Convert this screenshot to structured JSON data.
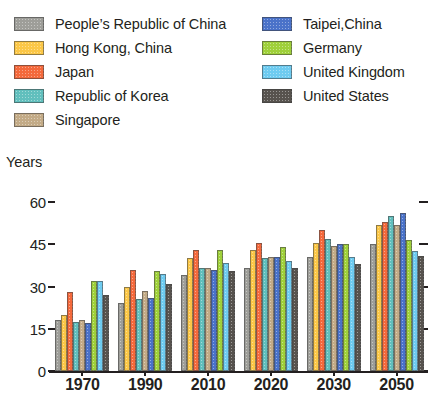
{
  "legend": {
    "left_column": [
      {
        "label": "People’s Republic of China",
        "color": "#9e9e99",
        "swatch_name": "legend-swatch-prc"
      },
      {
        "label": "Hong Kong, China",
        "color": "#fbc747",
        "swatch_name": "legend-swatch-hong-kong"
      },
      {
        "label": "Japan",
        "color": "#f4693c",
        "swatch_name": "legend-swatch-japan"
      },
      {
        "label": "Republic of Korea",
        "color": "#61bfbd",
        "swatch_name": "legend-swatch-korea"
      },
      {
        "label": "Singapore",
        "color": "#c3ab87",
        "swatch_name": "legend-swatch-singapore"
      }
    ],
    "right_column": [
      {
        "label": "Taipei,China",
        "color": "#4a72c9",
        "swatch_name": "legend-swatch-taipei"
      },
      {
        "label": "Germany",
        "color": "#9fd03a",
        "swatch_name": "legend-swatch-germany"
      },
      {
        "label": "United Kingdom",
        "color": "#6ecbf0",
        "swatch_name": "legend-swatch-uk"
      },
      {
        "label": "United States",
        "color": "#57534e",
        "swatch_name": "legend-swatch-usa"
      }
    ]
  },
  "chart_data": {
    "type": "bar",
    "title": "",
    "xlabel": "",
    "ylabel": "Years",
    "ylim": [
      0,
      60
    ],
    "yticks": [
      0,
      15,
      30,
      45,
      60
    ],
    "ytick_labels": [
      "0",
      "15",
      "30",
      "45",
      "60"
    ],
    "grid": false,
    "legend_position": "top",
    "categories": [
      "1970",
      "1990",
      "2010",
      "2020",
      "2030",
      "2050"
    ],
    "series": [
      {
        "name": "People’s Republic of China",
        "color": "#9e9e99",
        "values": [
          18,
          24,
          34,
          36.5,
          40.5,
          45
        ]
      },
      {
        "name": "Hong Kong, China",
        "color": "#fbc747",
        "values": [
          20,
          30,
          40,
          43,
          45.5,
          52
        ]
      },
      {
        "name": "Japan",
        "color": "#f4693c",
        "values": [
          28,
          36,
          43,
          45.5,
          50,
          53
        ]
      },
      {
        "name": "Republic of Korea",
        "color": "#61bfbd",
        "values": [
          17.5,
          25.5,
          36.5,
          40,
          47,
          55
        ]
      },
      {
        "name": "Singapore",
        "color": "#c3ab87",
        "values": [
          18,
          28.5,
          36.5,
          40.5,
          44.5,
          52
        ]
      },
      {
        "name": "Taipei,China",
        "color": "#4a72c9",
        "values": [
          17,
          26,
          36,
          40.5,
          45,
          56
        ]
      },
      {
        "name": "Germany",
        "color": "#9fd03a",
        "values": [
          32,
          35.5,
          43,
          44,
          45,
          46.5
        ]
      },
      {
        "name": "United Kingdom",
        "color": "#6ecbf0",
        "values": [
          32,
          34.5,
          38.5,
          39,
          40.5,
          42.5
        ]
      },
      {
        "name": "United States",
        "color": "#57534e",
        "values": [
          27,
          31,
          35.5,
          36.5,
          38,
          41
        ]
      }
    ]
  }
}
